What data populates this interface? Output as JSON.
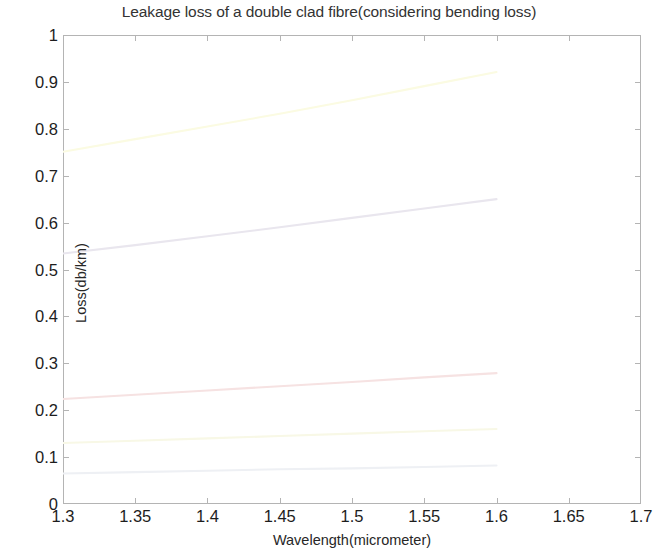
{
  "chart_data": {
    "type": "line",
    "title": "Leakage loss of a double clad fibre(considering bending loss)",
    "xlabel": "Wavelength(micrometer)",
    "ylabel": "Loss(db/km)",
    "xlim": [
      1.3,
      1.7
    ],
    "ylim": [
      0,
      1
    ],
    "xticks": [
      1.3,
      1.35,
      1.4,
      1.45,
      1.5,
      1.55,
      1.6,
      1.65,
      1.7
    ],
    "xticklabels": [
      "1.3",
      "1.35",
      "1.4",
      "1.45",
      "1.5",
      "1.55",
      "1.6",
      "1.65",
      "1.7"
    ],
    "yticks": [
      0,
      0.1,
      0.2,
      0.3,
      0.4,
      0.5,
      0.6,
      0.7,
      0.8,
      0.9,
      1
    ],
    "yticklabels": [
      "0",
      "0.1",
      "0.2",
      "0.3",
      "0.4",
      "0.5",
      "0.6",
      "0.7",
      "0.8",
      "0.9",
      "1"
    ],
    "grid": false,
    "legend": "none",
    "x": [
      1.3,
      1.35,
      1.4,
      1.45,
      1.5,
      1.55,
      1.6
    ],
    "series": [
      {
        "name": "curve-1",
        "color": "#fbfbe2",
        "values": [
          0.751,
          0.778,
          0.805,
          0.832,
          0.861,
          0.891,
          0.921
        ]
      },
      {
        "name": "curve-2",
        "color": "#e9e6ee",
        "values": [
          0.534,
          0.552,
          0.571,
          0.59,
          0.61,
          0.63,
          0.65
        ]
      },
      {
        "name": "curve-3",
        "color": "#f6e2e2",
        "values": [
          0.224,
          0.233,
          0.242,
          0.251,
          0.26,
          0.27,
          0.279
        ]
      },
      {
        "name": "curve-4",
        "color": "#f8f8e6",
        "values": [
          0.13,
          0.135,
          0.14,
          0.145,
          0.15,
          0.155,
          0.16
        ]
      },
      {
        "name": "curve-5",
        "color": "#eef0f4",
        "values": [
          0.065,
          0.068,
          0.071,
          0.074,
          0.076,
          0.079,
          0.082
        ]
      }
    ]
  },
  "colors": {
    "axis": "#b4b4b4",
    "text": "#1d1d1d",
    "background": "#ffffff"
  }
}
